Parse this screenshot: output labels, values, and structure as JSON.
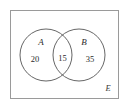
{
  "diagram": {
    "type": "venn-two-set",
    "universal_set_label": "E",
    "sets": [
      {
        "id": "A",
        "label": "A",
        "region_count": "20"
      },
      {
        "id": "B",
        "label": "B",
        "region_count": "35"
      }
    ],
    "intersection_count": "15",
    "colors": {
      "background": "#ffffff",
      "rectangle_border": "#9a9a9a",
      "circle_stroke": "#555555",
      "text": "#2b2b2b"
    }
  }
}
